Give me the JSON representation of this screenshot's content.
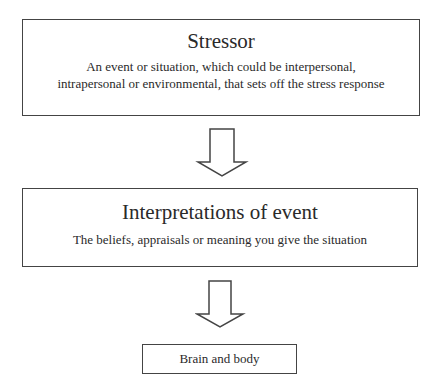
{
  "diagram": {
    "type": "flowchart",
    "direction": "top-to-bottom",
    "nodes": [
      {
        "id": "stressor",
        "title": "Stressor",
        "description": "An event or situation, which could be interpersonal, intrapersonal or environmental, that sets off the stress response"
      },
      {
        "id": "interpretations",
        "title": "Interpretations of event",
        "description": "The beliefs, appraisals or meaning you give the situation"
      },
      {
        "id": "brain-body",
        "title": "Brain and body"
      }
    ],
    "edges": [
      {
        "from": "stressor",
        "to": "interpretations",
        "style": "hollow-block-arrow"
      },
      {
        "from": "interpretations",
        "to": "brain-body",
        "style": "hollow-block-arrow"
      }
    ],
    "colors": {
      "border": "#444444",
      "text": "#2a2a2a",
      "background": "#ffffff"
    }
  }
}
